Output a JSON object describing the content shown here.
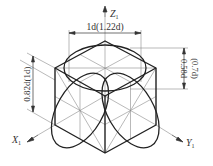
{
  "diagram": {
    "type": "isometric-cube-with-inscribed-circles",
    "axes": {
      "z": {
        "label": "Z",
        "subscript": "1"
      },
      "x": {
        "label": "X",
        "subscript": "1"
      },
      "y": {
        "label": "Y",
        "subscript": "1"
      }
    },
    "dimensions": {
      "top_width": "1d(1.22d)",
      "left_height": "0.82d(1d)",
      "right_height_main": "0.58d",
      "right_height_alt": "(0.7d)"
    },
    "colors": {
      "stroke_main": "#222222",
      "stroke_thin": "#888888",
      "background": "#ffffff"
    }
  }
}
